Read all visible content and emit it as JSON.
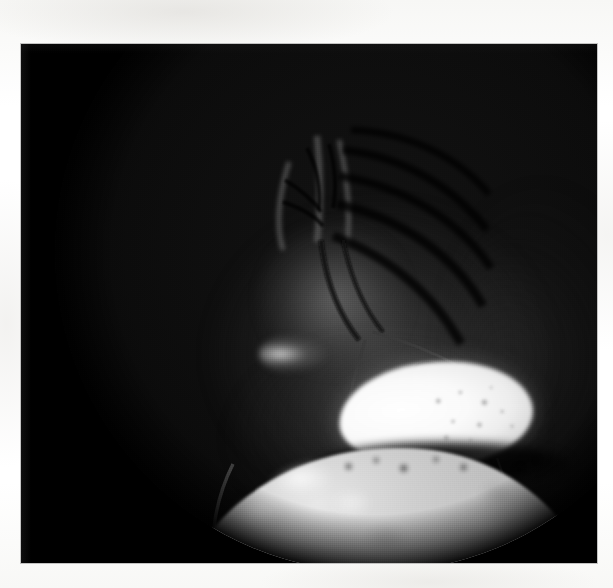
{
  "document": {
    "kind": "scanned-photographic-plate",
    "page_background_color": "#fbfbfa",
    "caption": ""
  },
  "plate": {
    "label": "fundus-photograph",
    "frame_color": "#030303",
    "left": 21,
    "top": 44,
    "width": 576,
    "height": 519,
    "modality_appearance": "monochrome fluorescein angiography style",
    "aperture": {
      "shape": "circle",
      "center_x": 354,
      "center_y": 208,
      "radius": 320,
      "outside_color": "#000000"
    }
  },
  "features": [
    {
      "id": "optic-nerve-head",
      "label": "Optic nerve head with radiating vascular arcades",
      "region": "upper-center",
      "brightness": "dim gray",
      "center_x": 313,
      "center_y": 255
    },
    {
      "id": "bright-ovoid-mass",
      "label": "Bright hyperfluorescent ovoid mass",
      "region": "center-right",
      "brightness": "saturated white",
      "center_x": 415,
      "center_y": 370,
      "width": 194,
      "height": 104
    },
    {
      "id": "granular-mottling",
      "label": "Granular mottling over mass",
      "region": "right side of mass",
      "brightness": "mid gray speckle"
    },
    {
      "id": "dark-separating-band",
      "label": "Dark band below mass",
      "region": "below mass",
      "brightness": "black"
    },
    {
      "id": "lower-bright-field",
      "label": "Large mottled hyperfluorescent field",
      "region": "lower",
      "brightness": "light gray mottled",
      "center_x": 365,
      "center_y": 520
    },
    {
      "id": "crossing-vessels",
      "label": "Dark retinal vessels crossing bright regions",
      "region": "throughout",
      "brightness": "dark gray lines"
    }
  ],
  "colors": {
    "paper": "#fbfbfa",
    "plate_black": "#030303",
    "highlight_white": "#ffffff",
    "mid_gray": "#b8b8b8",
    "vessel_dark": "#2a2a2a"
  }
}
